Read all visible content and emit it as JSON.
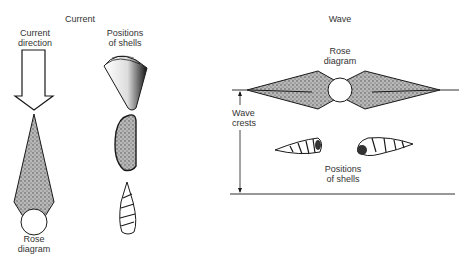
{
  "current_panel": {
    "title": "Current",
    "direction_label_line1": "Current",
    "direction_label_line2": "direction",
    "positions_label_line1": "Positions",
    "positions_label_line2": "of shells",
    "rose_label_line1": "Rose",
    "rose_label_line2": "diagram",
    "shells": [
      "cone-shell",
      "bivalve-shell",
      "turret-shell"
    ]
  },
  "wave_panel": {
    "title": "Wave",
    "rose_label_line1": "Rose",
    "rose_label_line2": "diagram",
    "crests_label_line1": "Wave",
    "crests_label_line2": "crests",
    "positions_label_line1": "Positions",
    "positions_label_line2": "of shells",
    "shells": [
      "turret-shell-left",
      "turret-shell-right"
    ]
  },
  "colors": {
    "ink": "#1a1a1a",
    "stipple": "#8a8a8a",
    "background": "#ffffff"
  }
}
